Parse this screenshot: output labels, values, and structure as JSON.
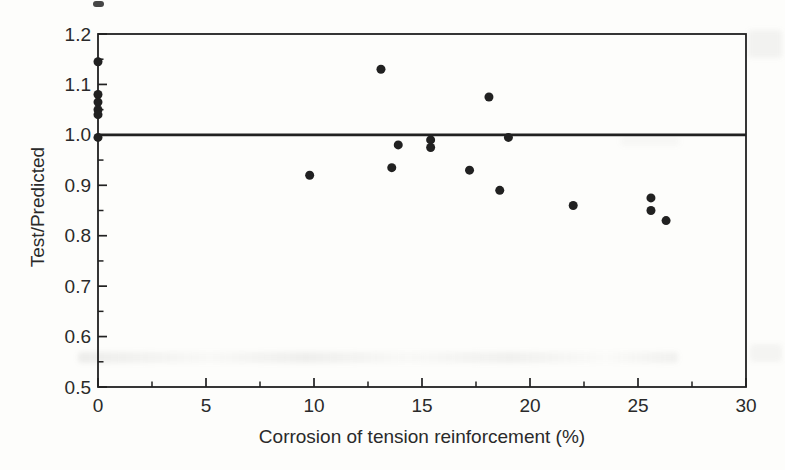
{
  "colors": {
    "ink": "#212121",
    "label_ink": "#2a2a2a",
    "paper": "#fdfdfb"
  },
  "chart_data": {
    "type": "scatter",
    "title": "",
    "xlabel": "Corrosion of tension reinforcement (%)",
    "ylabel": "Test/Predicted",
    "xlim": [
      0,
      30
    ],
    "ylim": [
      0.5,
      1.2
    ],
    "grid": false,
    "legend": null,
    "reference_line_y": 1.0,
    "x_ticks": [
      {
        "value": 0,
        "label": "0"
      },
      {
        "value": 5,
        "label": "5"
      },
      {
        "value": 10,
        "label": "10"
      },
      {
        "value": 15,
        "label": "15"
      },
      {
        "value": 20,
        "label": "20"
      },
      {
        "value": 25,
        "label": "25"
      },
      {
        "value": 30,
        "label": "30"
      }
    ],
    "x_minor_ticks": [
      2.5,
      7.5,
      12.5,
      17.5,
      22.5,
      27.5
    ],
    "y_ticks": [
      {
        "value": 0.5,
        "label": "0.5"
      },
      {
        "value": 0.6,
        "label": "0.6"
      },
      {
        "value": 0.7,
        "label": "0.7"
      },
      {
        "value": 0.8,
        "label": "0.8"
      },
      {
        "value": 0.9,
        "label": "0.9"
      },
      {
        "value": 1.0,
        "label": "1.0"
      },
      {
        "value": 1.1,
        "label": "1.1"
      },
      {
        "value": 1.2,
        "label": "1.2"
      }
    ],
    "y_minor_ticks": [
      0.55,
      0.65,
      0.75,
      0.85,
      0.95,
      1.05,
      1.15
    ],
    "points": [
      [
        0,
        1.145
      ],
      [
        0,
        1.08
      ],
      [
        0,
        1.065
      ],
      [
        0,
        1.05
      ],
      [
        0,
        1.04
      ],
      [
        0,
        0.995
      ],
      [
        9.8,
        0.92
      ],
      [
        13.1,
        1.13
      ],
      [
        13.6,
        0.935
      ],
      [
        13.9,
        0.98
      ],
      [
        15.4,
        0.99
      ],
      [
        15.4,
        0.975
      ],
      [
        17.2,
        0.93
      ],
      [
        18.1,
        1.075
      ],
      [
        18.6,
        0.89
      ],
      [
        19.0,
        0.995
      ],
      [
        22.0,
        0.86
      ],
      [
        25.6,
        0.875
      ],
      [
        25.6,
        0.85
      ],
      [
        26.3,
        0.83
      ]
    ]
  }
}
